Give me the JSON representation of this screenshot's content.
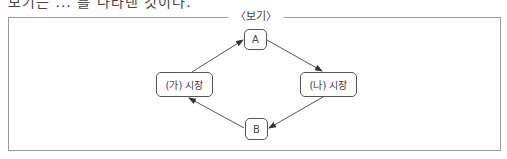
{
  "header": {
    "cropped_text": "보기는 ... 를 나타낸 것이다."
  },
  "box": {
    "title": "〈보기〉"
  },
  "diagram": {
    "nodes": {
      "a": {
        "label": "A"
      },
      "b": {
        "label": "B"
      },
      "ga_market": {
        "label": "(가) 시장"
      },
      "na_market": {
        "label": "(나) 시장"
      }
    },
    "edges": [
      {
        "from": "(가) 시장",
        "to": "A"
      },
      {
        "from": "A",
        "to": "(나) 시장"
      },
      {
        "from": "(나) 시장",
        "to": "B"
      },
      {
        "from": "B",
        "to": "(가) 시장"
      }
    ],
    "colors": {
      "line": "#555555",
      "frame": "#9a9a9a"
    }
  }
}
